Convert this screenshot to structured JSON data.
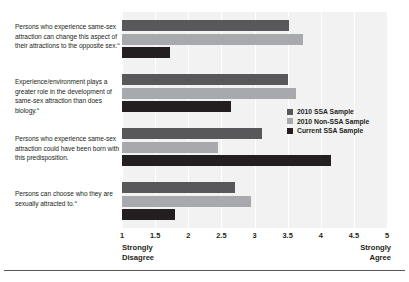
{
  "chart_data": {
    "type": "bar",
    "orientation": "horizontal",
    "title": "",
    "xlabel": "",
    "ylabel": "",
    "xlim": [
      1,
      5
    ],
    "xticks": [
      "1",
      "1.5",
      "2",
      "2.5",
      "3",
      "3.5",
      "4",
      "4.5",
      "5"
    ],
    "xtick_values": [
      1,
      1.5,
      2,
      2.5,
      3,
      3.5,
      4,
      4.5,
      5
    ],
    "axis_low_label": "Strongly\nDisagree",
    "axis_high_label": "Strongly\nAgree",
    "grid": true,
    "legend_position": "right-middle",
    "categories": [
      "Persons who experience same-sex attraction can change this aspect of their attractions to the opposite sex.",
      "Experience/environment plays a greater role in the development of same-sex attraction than does biology.",
      "Persons who experience same-sex attraction could have been born with this predisposition.",
      "Persons can choose who they are sexually attracted to."
    ],
    "category_footnote_markers": [
      "a",
      "a",
      "",
      "a"
    ],
    "series": [
      {
        "name": "2010 SSA Sample",
        "color": "#58585a",
        "values": [
          3.52,
          3.5,
          3.12,
          2.7
        ]
      },
      {
        "name": "2010 Non-SSA Sample",
        "color": "#a7a9ac",
        "values": [
          3.73,
          3.62,
          2.45,
          2.95
        ]
      },
      {
        "name": "Current SSA Sample",
        "color": "#231f20",
        "values": [
          1.73,
          2.65,
          4.15,
          1.8
        ]
      }
    ]
  },
  "axis": {
    "low_line1": "Strongly",
    "low_line2": "Disagree",
    "high_line1": "Strongly",
    "high_line2": "Agree"
  },
  "legend": {
    "items": [
      {
        "label": "2010 SSA Sample"
      },
      {
        "label": "2010 Non-SSA Sample"
      },
      {
        "label": "Current SSA Sample"
      }
    ]
  },
  "labels": {
    "cat0_line1": "Persons who experience same-sex",
    "cat0_line2": "attraction can change this aspect of",
    "cat0_line3": "their attractions to the opposite sex.",
    "cat0_sup": "a",
    "cat1_line1": "Experience/environment plays a",
    "cat1_line2": "greater role in the development of",
    "cat1_line3": "same-sex attraction than does biology.",
    "cat1_sup": "a",
    "cat2_line1": "Persons who experience same-sex",
    "cat2_line2": "attraction could have been born with",
    "cat2_line3": "this predisposition.",
    "cat3_line1": "Persons can choose who they are",
    "cat3_line2": "sexually attracted to.",
    "cat3_sup": "a"
  }
}
